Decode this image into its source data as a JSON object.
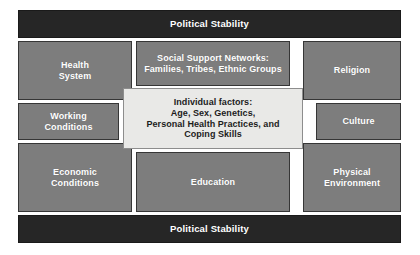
{
  "diagram": {
    "colors": {
      "canvas": "#ffffff",
      "banner_fill": "#262626",
      "banner_text": "#ffffff",
      "box_fill": "#7d7d7d",
      "box_border": "#363636",
      "box_text": "#ffffff",
      "center_fill": "#e9e9e7",
      "center_border": "#8d8d8d",
      "center_text": "#1c1c1c"
    },
    "banners": {
      "top": "Political Stability",
      "bottom": "Political Stability"
    },
    "center": {
      "label": "Individual factors:\nAge, Sex, Genetics,\nPersonal Health Practices, and\nCoping Skills"
    },
    "boxes": {
      "health_system": "Health\nSystem",
      "social_support": "Social Support Networks:\nFamilies, Tribes, Ethnic Groups",
      "religion": "Religion",
      "working_conditions": "Working\nConditions",
      "culture": "Culture",
      "economic_conditions": "Economic\nConditions",
      "education": "Education",
      "physical_environment": "Physical\nEnvironment"
    }
  }
}
